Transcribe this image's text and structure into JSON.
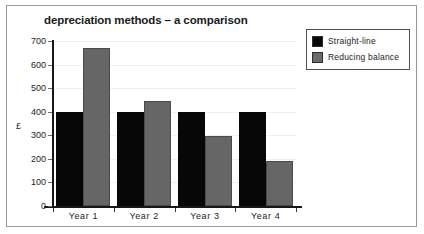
{
  "chart_data": {
    "type": "bar",
    "title": "depreciation methods – a comparison",
    "xlabel": "",
    "ylabel": "£",
    "categories": [
      "Year 1",
      "Year 2",
      "Year 3",
      "Year 4"
    ],
    "series": [
      {
        "name": "Straight-line",
        "color": "#070707",
        "values": [
          400,
          400,
          400,
          400
        ]
      },
      {
        "name": "Reducing balance",
        "color": "#666666",
        "values": [
          670,
          445,
          295,
          190
        ]
      }
    ],
    "ylim": [
      0,
      700
    ],
    "ytick_step": 100,
    "yticks": [
      "0",
      "100",
      "200",
      "300",
      "400",
      "500",
      "600",
      "700"
    ],
    "grid": true,
    "legend_position": "top-right"
  },
  "legend": {
    "items": [
      {
        "label": "Straight-line"
      },
      {
        "label": "Reducing balance"
      }
    ]
  }
}
